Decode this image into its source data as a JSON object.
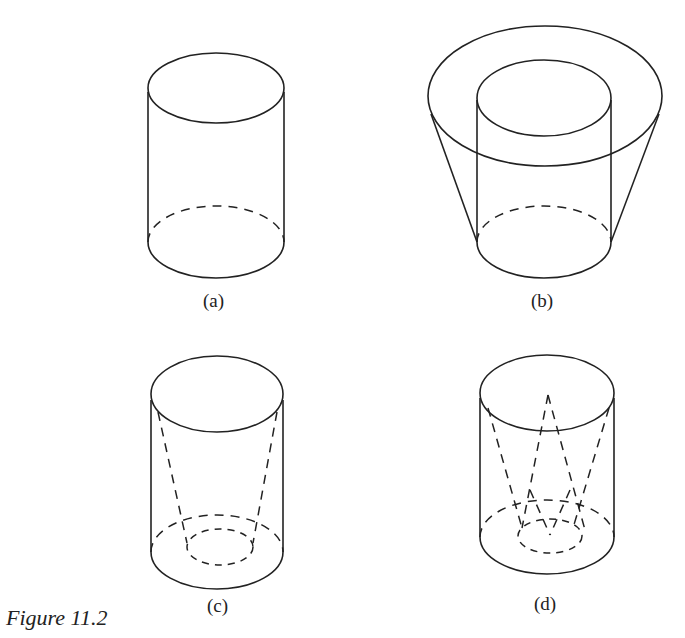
{
  "figure": {
    "caption": "Figure 11.2",
    "panels": [
      {
        "id": "a",
        "label": "(a)",
        "shape": "cylinder"
      },
      {
        "id": "b",
        "label": "(b)",
        "shape": "cylinder with outer truncated cone"
      },
      {
        "id": "c",
        "label": "(c)",
        "shape": "cylinder with inner dashed truncated cone"
      },
      {
        "id": "d",
        "label": "(d)",
        "shape": "cylinder with inner dashed crossing cones"
      }
    ]
  }
}
